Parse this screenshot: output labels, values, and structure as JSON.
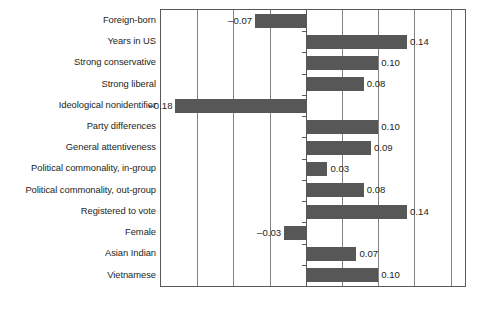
{
  "chart_data": {
    "type": "bar",
    "orientation": "horizontal",
    "title": "",
    "subtitle": "",
    "xlabel": "",
    "ylabel": "",
    "xlim": [
      -0.2,
      0.22
    ],
    "grid": true,
    "gridlines": [
      -0.15,
      -0.1,
      -0.05,
      0.0,
      0.05,
      0.1,
      0.15,
      0.2
    ],
    "zero_line": 0.0,
    "tick_labels_visible": false,
    "legend": null,
    "bar_color": "#575757",
    "categories": [
      "Foreign-born",
      "Years in US",
      "Strong conservative",
      "Strong liberal",
      "Ideological nonidentifier",
      "Party differences",
      "General attentiveness",
      "Political commonality, in-group",
      "Political commonality, out-group",
      "Registered to vote",
      "Female",
      "Asian Indian",
      "Vietnamese"
    ],
    "values": [
      -0.07,
      0.14,
      0.1,
      0.08,
      -0.18,
      0.1,
      0.09,
      0.03,
      0.08,
      0.14,
      -0.03,
      0.07,
      0.1
    ],
    "value_labels": [
      "–0.07",
      "0.14",
      "0.10",
      "0.08",
      "–0.18",
      "0.10",
      "0.09",
      "0.03",
      "0.08",
      "0.14",
      "–0.03",
      "0.07",
      "0.10"
    ]
  },
  "caption": ""
}
